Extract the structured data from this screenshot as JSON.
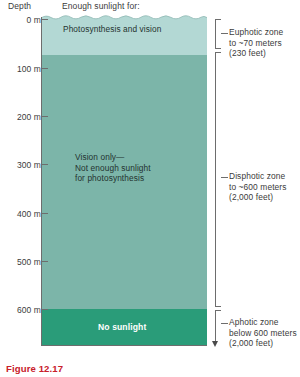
{
  "header": {
    "depth_axis_title": "Depth",
    "sunlight_header": "Enough sunlight for:"
  },
  "depth_scale": {
    "unit": "m",
    "ticks": [
      {
        "label": "0 m",
        "value": 0
      },
      {
        "label": "100 m",
        "value": 100
      },
      {
        "label": "200 m",
        "value": 200
      },
      {
        "label": "300 m",
        "value": 300
      },
      {
        "label": "400 m",
        "value": 400
      },
      {
        "label": "500 m",
        "value": 500
      },
      {
        "label": "600 m",
        "value": 600
      }
    ]
  },
  "layers": [
    {
      "name": "euphotic",
      "caption": "Photosynthesis and vision",
      "color": "#b3d8d4",
      "depth_from": 0,
      "depth_to": 70
    },
    {
      "name": "disphotic",
      "caption_line1": "Vision only—",
      "caption_line2": "Not enough sunlight",
      "caption_line3": "for photosynthesis",
      "color": "#7cb5a9",
      "depth_from": 70,
      "depth_to": 600
    },
    {
      "name": "aphotic",
      "caption": "No sunlight",
      "color": "#2a9c79",
      "depth_from": 600,
      "depth_to": 660
    }
  ],
  "annotations": [
    {
      "name": "euphotic",
      "line1": "Euphotic zone",
      "line2": "to ~70 meters",
      "line3": "(230 feet)"
    },
    {
      "name": "disphotic",
      "line1": "Disphotic zone",
      "line2": "to ~600 meters",
      "line3": "(2,000 feet)"
    },
    {
      "name": "aphotic",
      "line1": "Aphotic zone",
      "line2": "below 600 meters",
      "line3": "(2,000 feet)"
    }
  ],
  "figure": {
    "caption": "Figure 12.17",
    "caption_color": "#c8202a"
  }
}
